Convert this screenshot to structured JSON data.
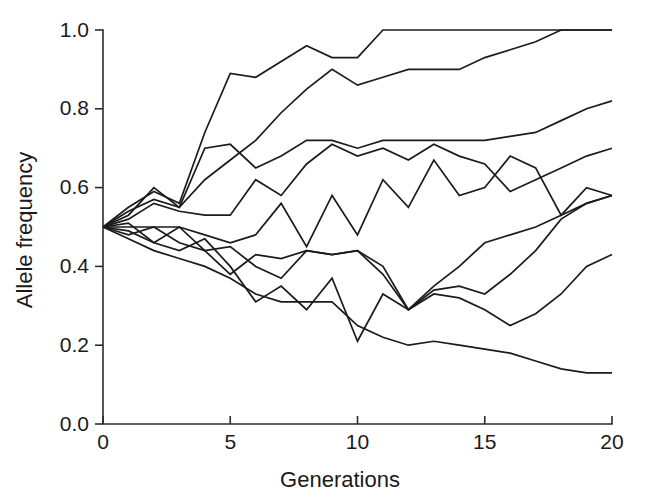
{
  "chart_data": {
    "type": "line",
    "title": "",
    "xlabel": "Generations",
    "ylabel": "Allele frequency",
    "xlim": [
      0,
      20
    ],
    "ylim": [
      0.0,
      1.0
    ],
    "xticks": [
      0,
      5,
      10,
      15,
      20
    ],
    "xticklabels": [
      "0",
      "5",
      "10",
      "15",
      "20"
    ],
    "yticks": [
      0.0,
      0.2,
      0.4,
      0.6,
      0.8,
      1.0
    ],
    "yticklabels": [
      "0.0",
      "0.2",
      "0.4",
      "0.6",
      "0.8",
      "1.0"
    ],
    "grid": false,
    "legend": "none",
    "line_color": "#1b1b1b",
    "background_color": "#ffffff",
    "x": [
      0,
      1,
      2,
      3,
      4,
      5,
      6,
      7,
      8,
      9,
      10,
      11,
      12,
      13,
      14,
      15,
      16,
      17,
      18,
      19,
      20
    ],
    "series": [
      {
        "name": "replicate-1",
        "values": [
          0.5,
          0.55,
          0.59,
          0.56,
          0.74,
          0.89,
          0.88,
          0.92,
          0.96,
          0.93,
          0.93,
          1.0,
          1.0,
          1.0,
          1.0,
          1.0,
          1.0,
          1.0,
          1.0,
          1.0,
          1.0
        ]
      },
      {
        "name": "replicate-2",
        "values": [
          0.5,
          0.54,
          0.57,
          0.55,
          0.62,
          0.67,
          0.72,
          0.79,
          0.85,
          0.9,
          0.86,
          0.88,
          0.9,
          0.9,
          0.9,
          0.93,
          0.95,
          0.97,
          1.0,
          1.0,
          1.0
        ]
      },
      {
        "name": "replicate-3",
        "values": [
          0.5,
          0.53,
          0.6,
          0.55,
          0.7,
          0.71,
          0.65,
          0.68,
          0.72,
          0.72,
          0.7,
          0.72,
          0.72,
          0.72,
          0.72,
          0.72,
          0.73,
          0.74,
          0.77,
          0.8,
          0.82
        ]
      },
      {
        "name": "replicate-4",
        "values": [
          0.5,
          0.52,
          0.56,
          0.54,
          0.53,
          0.53,
          0.62,
          0.58,
          0.66,
          0.71,
          0.68,
          0.7,
          0.67,
          0.71,
          0.68,
          0.66,
          0.59,
          0.62,
          0.65,
          0.68,
          0.7
        ]
      },
      {
        "name": "replicate-5",
        "values": [
          0.5,
          0.5,
          0.5,
          0.5,
          0.48,
          0.46,
          0.48,
          0.56,
          0.45,
          0.58,
          0.48,
          0.62,
          0.55,
          0.67,
          0.58,
          0.6,
          0.68,
          0.65,
          0.53,
          0.6,
          0.58
        ]
      },
      {
        "name": "replicate-6",
        "values": [
          0.5,
          0.51,
          0.46,
          0.5,
          0.44,
          0.38,
          0.43,
          0.42,
          0.44,
          0.43,
          0.44,
          0.38,
          0.29,
          0.34,
          0.35,
          0.33,
          0.38,
          0.44,
          0.52,
          0.56,
          0.58
        ]
      },
      {
        "name": "replicate-7",
        "values": [
          0.5,
          0.48,
          0.5,
          0.46,
          0.44,
          0.45,
          0.4,
          0.37,
          0.44,
          0.43,
          0.44,
          0.4,
          0.29,
          0.33,
          0.32,
          0.29,
          0.25,
          0.28,
          0.33,
          0.4,
          0.43
        ]
      },
      {
        "name": "replicate-8",
        "values": [
          0.5,
          0.49,
          0.46,
          0.44,
          0.47,
          0.4,
          0.31,
          0.35,
          0.29,
          0.37,
          0.21,
          0.33,
          0.29,
          0.35,
          0.4,
          0.46,
          0.48,
          0.5,
          0.53,
          0.56,
          0.58
        ]
      },
      {
        "name": "replicate-9",
        "values": [
          0.5,
          0.47,
          0.44,
          0.42,
          0.4,
          0.37,
          0.33,
          0.31,
          0.31,
          0.31,
          0.25,
          0.22,
          0.2,
          0.21,
          0.2,
          0.19,
          0.18,
          0.16,
          0.14,
          0.13,
          0.13
        ]
      }
    ]
  },
  "axes": {
    "xlabel": "Generations",
    "ylabel": "Allele frequency"
  }
}
